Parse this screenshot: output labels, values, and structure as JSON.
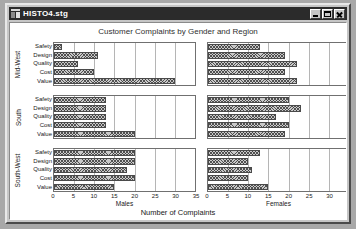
{
  "window": {
    "title": "HISTO4.stg",
    "icon": "document-chart-icon",
    "buttons": {
      "minimize": "minimize-button",
      "maximize": "maximize-button",
      "close": "close-button"
    }
  },
  "chart_data": {
    "type": "bar",
    "orientation": "horizontal",
    "title": "Customer Complaints by Gender and Region",
    "xlabel": "Number of Complaints",
    "ylabel": "",
    "xlim": [
      0,
      35
    ],
    "xticks": [
      0,
      5,
      10,
      15,
      20,
      25,
      30,
      35
    ],
    "grid": true,
    "legend": "none",
    "panel_columns": [
      "Males",
      "Females"
    ],
    "panel_rows": [
      "Mid-West",
      "South",
      "South-West"
    ],
    "categories": [
      "Safety",
      "Design",
      "Quality",
      "Cost",
      "Value"
    ],
    "panels": [
      {
        "row": "Mid-West",
        "column": "Males",
        "categories": [
          "Safety",
          "Design",
          "Quality",
          "Cost",
          "Value"
        ],
        "values": [
          2,
          11,
          6,
          10,
          30
        ]
      },
      {
        "row": "Mid-West",
        "column": "Females",
        "categories": [
          "Safety",
          "Design",
          "Quality",
          "Cost",
          "Value"
        ],
        "values": [
          13,
          19,
          22,
          19,
          22
        ]
      },
      {
        "row": "South",
        "column": "Males",
        "categories": [
          "Safety",
          "Design",
          "Quality",
          "Cost",
          "Value"
        ],
        "values": [
          13,
          13,
          13,
          13,
          20
        ]
      },
      {
        "row": "South",
        "column": "Females",
        "categories": [
          "Safety",
          "Design",
          "Quality",
          "Cost",
          "Value"
        ],
        "values": [
          20,
          23,
          17,
          20,
          19
        ]
      },
      {
        "row": "South-West",
        "column": "Males",
        "categories": [
          "Safety",
          "Design",
          "Quality",
          "Cost",
          "Value"
        ],
        "values": [
          20,
          20,
          18,
          20,
          15
        ]
      },
      {
        "row": "South-West",
        "column": "Females",
        "categories": [
          "Safety",
          "Design",
          "Quality",
          "Cost",
          "Value"
        ],
        "values": [
          13,
          10,
          11,
          10,
          15
        ]
      }
    ],
    "colors": {
      "bar_fill": "#c9c9c9",
      "bar_hatch": "#3c3c3c",
      "bar_edge": "#4a4a4a",
      "grid": "#b5b5b5",
      "panel_bg": "#ffffff",
      "text": "#202020",
      "title_text": "#303030"
    }
  }
}
